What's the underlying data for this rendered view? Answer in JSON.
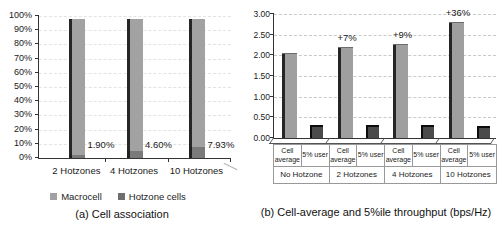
{
  "figure": {
    "background": "#ffffff"
  },
  "colors": {
    "macrocell": "#a2a2a2",
    "hotzone_cells": "#7a7a7a",
    "cell_average": "#9f9f9f",
    "user5": "#4b4b4b",
    "bar_shadow": "#141414",
    "axis": "#333333",
    "grid_a": "#e3e3e3",
    "grid_b": "#c9c9c9"
  },
  "chart_data": [
    {
      "type": "bar",
      "variant": "stacked-3d",
      "caption": "(a) Cell association",
      "categories": [
        "2 Hotzones",
        "4 Hotzones",
        "10 Hotzones"
      ],
      "series": [
        {
          "name": "Macrocell",
          "values": [
            98.1,
            95.4,
            92.07
          ]
        },
        {
          "name": "Hotzone cells",
          "values": [
            1.9,
            4.6,
            7.93
          ]
        }
      ],
      "data_labels": [
        "1.90%",
        "4.60%",
        "7.93%"
      ],
      "yticks": [
        "0%",
        "10%",
        "20%",
        "30%",
        "40%",
        "50%",
        "60%",
        "70%",
        "80%",
        "90%",
        "100%"
      ],
      "ylim": [
        0,
        100
      ],
      "grid": "dashed-faint",
      "legend": [
        "Macrocell",
        "Hotzone cells"
      ],
      "legend_position": "bottom"
    },
    {
      "type": "bar",
      "variant": "grouped-3d",
      "caption": "(b) Cell-average and 5%ile throughput (bps/Hz)",
      "groups": [
        "No Hotzone",
        "2 Hotzones",
        "4 Hotzones",
        "10 Hotzones"
      ],
      "bar_labels": [
        "Cell average",
        "5% user"
      ],
      "series": [
        {
          "name": "Cell average",
          "values": [
            2.05,
            2.2,
            2.27,
            2.8
          ]
        },
        {
          "name": "5% user",
          "values": [
            0.31,
            0.32,
            0.31,
            0.28
          ]
        }
      ],
      "annotations": [
        "",
        "+7%",
        "+9%",
        "+36%"
      ],
      "yticks": [
        "0.00",
        "0.50",
        "1.00",
        "1.50",
        "2.00",
        "2.50",
        "3.00"
      ],
      "ylim": [
        0,
        3.0
      ],
      "grid": "dashed",
      "legend": []
    }
  ]
}
